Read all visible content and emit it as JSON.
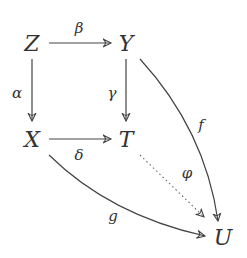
{
  "diagram": {
    "type": "commutative-diagram",
    "nodes": {
      "Z": "Z",
      "Y": "Y",
      "X": "X",
      "T": "T",
      "U": "U"
    },
    "arrows": {
      "beta": {
        "label": "β",
        "from": "Z",
        "to": "Y",
        "style": "solid"
      },
      "alpha": {
        "label": "α",
        "from": "Z",
        "to": "X",
        "style": "solid"
      },
      "gamma": {
        "label": "γ",
        "from": "Y",
        "to": "T",
        "style": "solid"
      },
      "delta": {
        "label": "δ",
        "from": "X",
        "to": "T",
        "style": "solid"
      },
      "f": {
        "label": "f",
        "from": "Y",
        "to": "U",
        "style": "solid-curved"
      },
      "phi": {
        "label": "φ",
        "from": "T",
        "to": "U",
        "style": "dotted"
      },
      "g": {
        "label": "g",
        "from": "X",
        "to": "U",
        "style": "solid-curved"
      }
    },
    "colors": {
      "stroke": "#444444",
      "text": "#333333"
    }
  }
}
